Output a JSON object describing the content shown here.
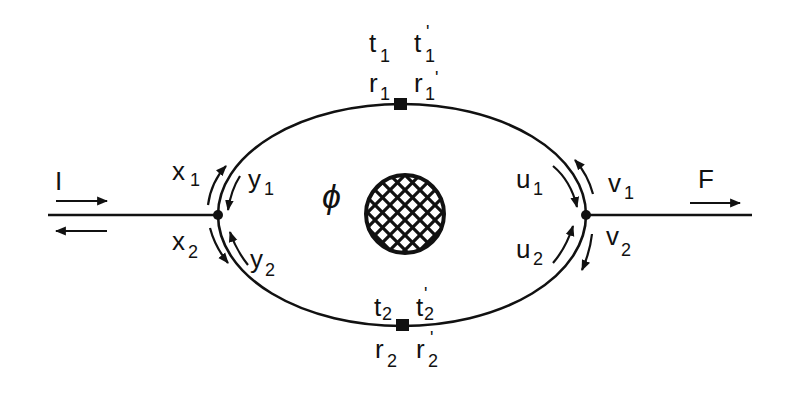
{
  "diagram": {
    "colors": {
      "ink": "#111111",
      "background": "#ffffff"
    },
    "input_lead": {
      "label": "I"
    },
    "output_lead": {
      "label": "F"
    },
    "flux": {
      "label": "ϕ"
    },
    "left_junction": {
      "labels": [
        {
          "main": "x",
          "sub": "1"
        },
        {
          "main": "y",
          "sub": "1"
        },
        {
          "main": "x",
          "sub": "2"
        },
        {
          "main": "y",
          "sub": "2"
        }
      ]
    },
    "right_junction": {
      "labels": [
        {
          "main": "u",
          "sub": "1"
        },
        {
          "main": "v",
          "sub": "1"
        },
        {
          "main": "u",
          "sub": "2"
        },
        {
          "main": "v",
          "sub": "2"
        }
      ]
    },
    "top_scatterer": {
      "labels": [
        {
          "main": "t",
          "sub": "1"
        },
        {
          "main": "t",
          "sub": "1",
          "prime": "'"
        },
        {
          "main": "r",
          "sub": "1"
        },
        {
          "main": "r",
          "sub": "1",
          "prime": "'"
        }
      ]
    },
    "bottom_scatterer": {
      "labels": [
        {
          "main": "t",
          "sub": "2"
        },
        {
          "main": "t",
          "sub": "2",
          "prime": "'"
        },
        {
          "main": "r",
          "sub": "2"
        },
        {
          "main": "r",
          "sub": "2",
          "prime": "'"
        }
      ]
    }
  }
}
